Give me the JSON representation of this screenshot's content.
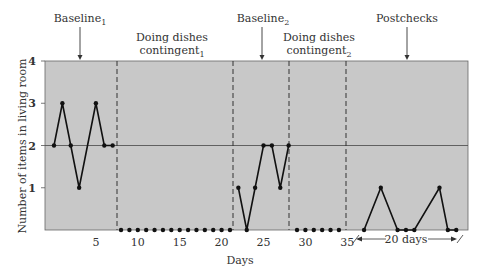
{
  "chart_data": {
    "type": "line",
    "title": "",
    "xlabel": "Days",
    "ylabel": "Number of items in living room",
    "ylim": [
      0,
      4
    ],
    "yticks": [
      "1",
      "2",
      "3",
      "4"
    ],
    "xticks": [
      "5",
      "10",
      "15",
      "20",
      "25",
      "30",
      "35"
    ],
    "reference_line_y": 2,
    "phases": [
      {
        "name": "Baseline",
        "sub": "1",
        "arrow": true
      },
      {
        "name": "Doing dishes contingent",
        "line1": "Doing dishes",
        "line2": "contingent",
        "sub": "1"
      },
      {
        "name": "Baseline",
        "sub": "2",
        "arrow": true
      },
      {
        "name": "Doing dishes contingent",
        "line1": "Doing dishes",
        "line2": "contingent",
        "sub": "2"
      },
      {
        "name": "Postchecks",
        "arrow": true
      }
    ],
    "postcheck_span_label": "20 days",
    "series": [
      {
        "name": "Baseline1",
        "x": [
          0,
          1,
          2,
          3,
          5,
          6,
          7
        ],
        "values": [
          2,
          3,
          2,
          1,
          3,
          2,
          2
        ]
      },
      {
        "name": "Doing dishes contingent1",
        "x": [
          8,
          9,
          10,
          11,
          12,
          13,
          14,
          15,
          16,
          17,
          18,
          19,
          20,
          21
        ],
        "values": [
          0,
          0,
          0,
          0,
          0,
          0,
          0,
          0,
          0,
          0,
          0,
          0,
          0,
          0
        ]
      },
      {
        "name": "Baseline2",
        "x": [
          22,
          23,
          24,
          25,
          26,
          27,
          28
        ],
        "values": [
          1,
          0,
          1,
          2,
          2,
          1,
          2
        ]
      },
      {
        "name": "Doing dishes contingent2",
        "x": [
          29,
          30,
          31,
          32,
          33,
          34
        ],
        "values": [
          0,
          0,
          0,
          0,
          0,
          0
        ]
      },
      {
        "name": "Postchecks",
        "x": [
          37,
          39,
          41,
          42,
          43,
          46,
          47,
          48
        ],
        "values": [
          0,
          1,
          0,
          0,
          0,
          1,
          0,
          0
        ]
      }
    ],
    "grid": false,
    "colors": {
      "plot_bg": "#c8c8c8",
      "line": "#111111",
      "divider": "#333333"
    }
  }
}
